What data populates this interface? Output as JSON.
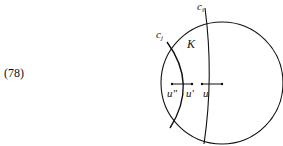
{
  "equation_number": "(78)",
  "diagram": {
    "region_label": "K",
    "curve_labels": {
      "ci": "c",
      "ci_sub": "i",
      "cj": "c",
      "cj_sub": "j"
    },
    "point_labels": {
      "u_double_prime": "u″",
      "u_prime": "u′",
      "u": "u"
    }
  }
}
